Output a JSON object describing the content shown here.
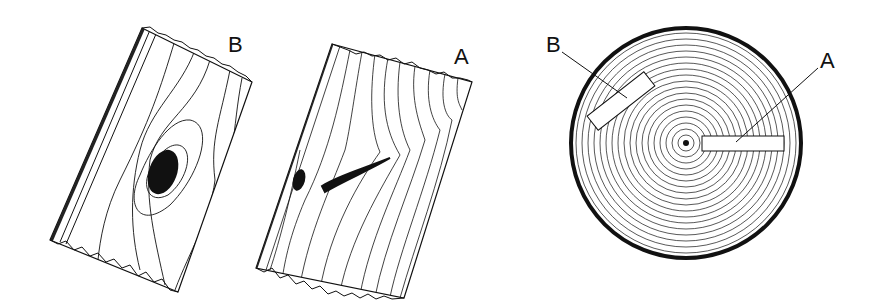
{
  "figure": {
    "boards": [
      {
        "id": "board-b",
        "label": "B",
        "feature": "round knot, flat-sawn grain"
      },
      {
        "id": "board-a",
        "label": "A",
        "feature": "spike knot, quarter-sawn grain"
      }
    ],
    "log": {
      "labels": [
        "B",
        "A"
      ],
      "callouts": [
        {
          "label": "B",
          "target": "tangential cut"
        },
        {
          "label": "A",
          "target": "radial cut"
        }
      ]
    }
  },
  "colors": {
    "ink": "#111111",
    "paper": "#ffffff"
  }
}
